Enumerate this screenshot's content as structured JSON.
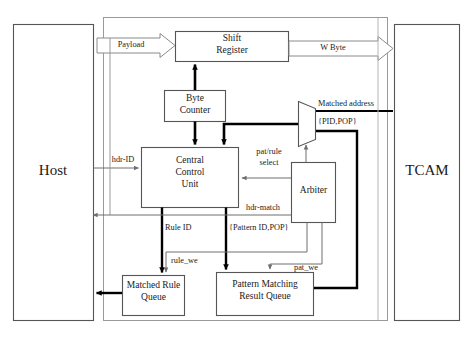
{
  "diagram": {
    "blocks": {
      "host": "Host",
      "tcam": "TCAM",
      "shift_register": "Shift\nRegister",
      "shift_register_l1": "Shift",
      "shift_register_l2": "Register",
      "byte_counter_l1": "Byte",
      "byte_counter_l2": "Counter",
      "ccu_l1": "Central",
      "ccu_l2": "Control",
      "ccu_l3": "Unit",
      "arbiter": "Arbiter",
      "matched_rule_queue_l1": "Matched Rule",
      "matched_rule_queue_l2": "Queue",
      "pattern_result_queue_l1": "Pattern Matching",
      "pattern_result_queue_l2": "Result Queue",
      "mux": "mux"
    },
    "signals": {
      "payload": "Payload",
      "w_byte": "W Byte",
      "matched_address": "Matched address",
      "pid_pop": "{PID,POP}",
      "hdr_id": "hdr-ID",
      "pat_rule_select_l1": "pat/rule",
      "pat_rule_select_l2": "select",
      "hdr_match": "hdr-match",
      "rule_id": "Rule ID",
      "pattern_id_pop": "{Pattern ID,POP}",
      "rule_we": "rule_we",
      "pat_we": "pat_we"
    },
    "colors": {
      "line_thin": "#6e6e6e",
      "line_thick": "#000000",
      "box_border": "#555555",
      "background": "#ffffff",
      "text": "#1a1a1a"
    }
  }
}
